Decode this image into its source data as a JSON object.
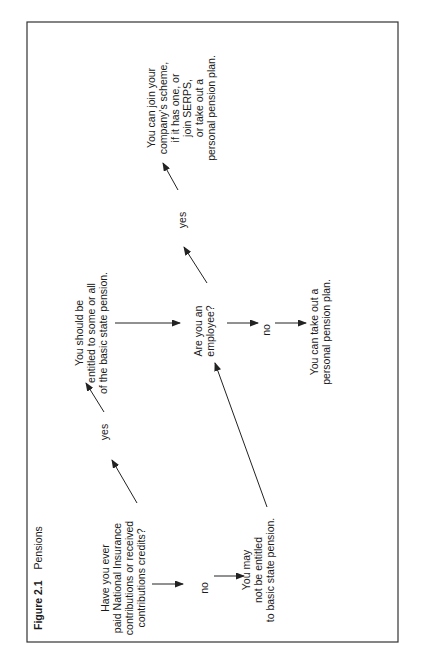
{
  "running_head": "CHOOSING A PENSION",
  "figure": {
    "number": "Figure 2.1",
    "title": "Pensions"
  },
  "nodes": {
    "q1": [
      "Have you ever",
      "paid National Insurance",
      "contributions or received",
      "contributions credits?"
    ],
    "no1_label": "no",
    "may_not": [
      "You may",
      "not be entitled",
      "to basic state pension."
    ],
    "yes1_label": "yes",
    "should_be": [
      "You should be",
      "entitled to some or all",
      "of the basic state pension."
    ],
    "q2": [
      "Are you an",
      "employee?"
    ],
    "no2_label": "no",
    "personal": [
      "You can take out a",
      "personal pension plan."
    ],
    "yes2_label": "yes",
    "company": [
      "You can join your",
      "company's scheme,",
      "if it has one, or",
      "join SERPS,",
      "or take out a",
      "personal pension plan."
    ]
  }
}
